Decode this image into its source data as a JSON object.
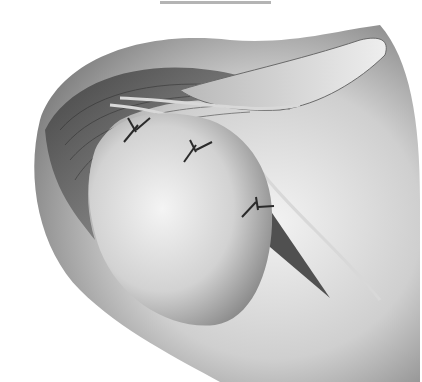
{
  "illustration": {
    "subject": "surgical anatomy illustration",
    "style": "grayscale airbrushed drawing",
    "elements": [
      "rounded tissue mass",
      "striated muscle fibers",
      "tendon strands",
      "three suture knots",
      "triangular muscle wedge"
    ],
    "suture_count": 3,
    "colors": {
      "background": "#ffffff",
      "tissue_light": "#e6e6e6",
      "tissue_mid": "#a8a8a8",
      "muscle_dark": "#4a4a4a",
      "suture": "#2a2a2a",
      "top_bar": "#b4b4b4"
    }
  }
}
